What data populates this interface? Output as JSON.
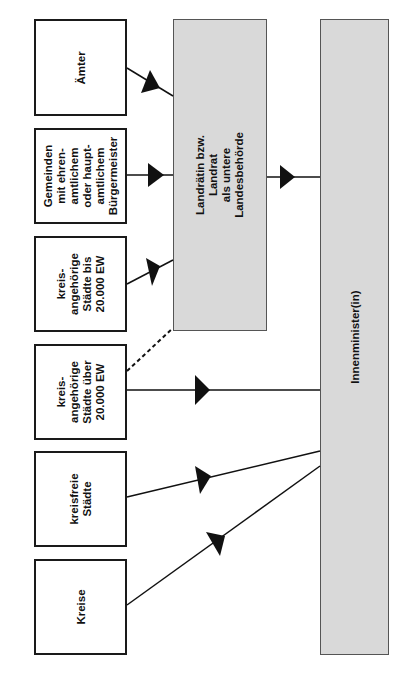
{
  "diagram": {
    "orientation": "rotated-90-ccw",
    "left_boxes": [
      {
        "id": "aemter",
        "label": "Ämter"
      },
      {
        "id": "gemeinden",
        "label": "Gemeinden\nmit ehren-\namtlichem\noder haupt-\namtlichem\nBürgermeister"
      },
      {
        "id": "kreis-bis",
        "label": "kreis-\nangehörige\nStädte bis\n20.000 EW"
      },
      {
        "id": "kreis-ueber",
        "label": "kreis-\nangehörige\nStädte über\n20.000 EW"
      },
      {
        "id": "kreisfreie",
        "label": "kreisfreie\nStädte"
      },
      {
        "id": "kreise",
        "label": "Kreise"
      }
    ],
    "middle_box": {
      "label": "Landrätin bzw.\nLandrat\nals untere\nLandesbehörde",
      "fill": "#d9d9d9"
    },
    "right_box": {
      "label": "Innenminister(in)",
      "fill": "#d9d9d9"
    },
    "edges": [
      {
        "from": "aemter",
        "to": "middle",
        "style": "solid",
        "arrow": true
      },
      {
        "from": "gemeinden",
        "to": "middle",
        "style": "solid",
        "arrow": true
      },
      {
        "from": "kreis-bis",
        "to": "middle",
        "style": "solid",
        "arrow": true
      },
      {
        "from": "kreis-ueber",
        "to": "middle",
        "style": "dashed",
        "arrow": false
      },
      {
        "from": "middle",
        "to": "right",
        "style": "solid",
        "arrow": true
      },
      {
        "from": "kreis-ueber",
        "to": "right",
        "style": "solid",
        "arrow": true
      },
      {
        "from": "kreisfreie",
        "to": "right",
        "style": "solid",
        "arrow": true
      },
      {
        "from": "kreise",
        "to": "right",
        "style": "solid",
        "arrow": true
      }
    ]
  }
}
